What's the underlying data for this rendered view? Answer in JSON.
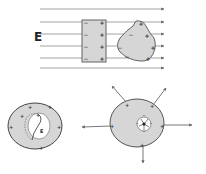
{
  "diagram": {
    "field_label": "E",
    "cavity_field_label": "E",
    "signs": {
      "positive": "+",
      "negative": "−"
    },
    "colors": {
      "conductor_fill": "#d6d6d6",
      "outline": "#555555",
      "field_line": "#8a8a8a",
      "background": "#ffffff"
    },
    "panels": [
      {
        "id": "uniform-field",
        "description": "Conductors (slab and irregular body) placed in a uniform external field E; induced negative charges on left, positive on right"
      },
      {
        "id": "hollow-conductor",
        "description": "Hollow charged conductor; positive charge on outer surface, dashed path through cavity, field E in cavity is zero"
      },
      {
        "id": "conductor-with-cavity-charge",
        "description": "Conductor with a charge inside its cavity; induced charges on cavity wall and outer surface; field lines radiate outward"
      }
    ]
  }
}
